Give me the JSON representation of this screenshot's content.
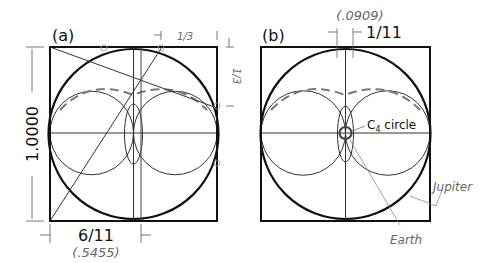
{
  "colors": {
    "frame": "#111111",
    "thin": "#333333",
    "faint": "#888888",
    "background": "#ffffff"
  },
  "panel_a": {
    "label": "(a)",
    "height_label": "1.0000",
    "bottom_fraction": "6/11",
    "bottom_decimal": "(.5455)",
    "top_right_fraction": "1/3",
    "right_top_fraction": "1/3"
  },
  "panel_b": {
    "label": "(b)",
    "top_fraction": "1/11",
    "top_decimal": "(.0909)",
    "c4_label_main": "C",
    "c4_label_sub": "4",
    "c4_label_rest": " circle",
    "jupiter_label": "Jupiter",
    "earth_label": "Earth"
  }
}
